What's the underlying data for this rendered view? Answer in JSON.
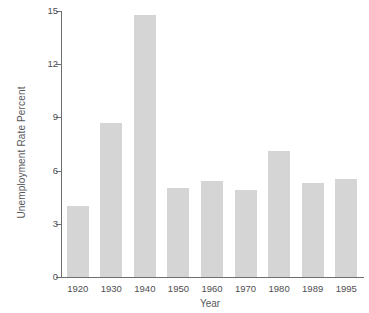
{
  "chart_data": {
    "type": "bar",
    "title": "",
    "xlabel": "Year",
    "ylabel": "Unemployment Rate Percent",
    "categories": [
      "1920",
      "1930",
      "1940",
      "1950",
      "1960",
      "1970",
      "1980",
      "1989",
      "1995"
    ],
    "values": [
      4.0,
      8.7,
      14.8,
      5.0,
      5.4,
      4.9,
      7.1,
      5.3,
      5.5
    ],
    "ylim": [
      0,
      15
    ],
    "yticks": [
      0,
      3,
      6,
      9,
      12,
      15
    ],
    "ytick_labels": [
      "0",
      "3",
      "6",
      "9",
      "12",
      "15"
    ],
    "grid": false,
    "legend": null,
    "bar_color": "#d5d5d5",
    "axis_color": "#6d6e70",
    "text_color": "#4e4e50"
  }
}
